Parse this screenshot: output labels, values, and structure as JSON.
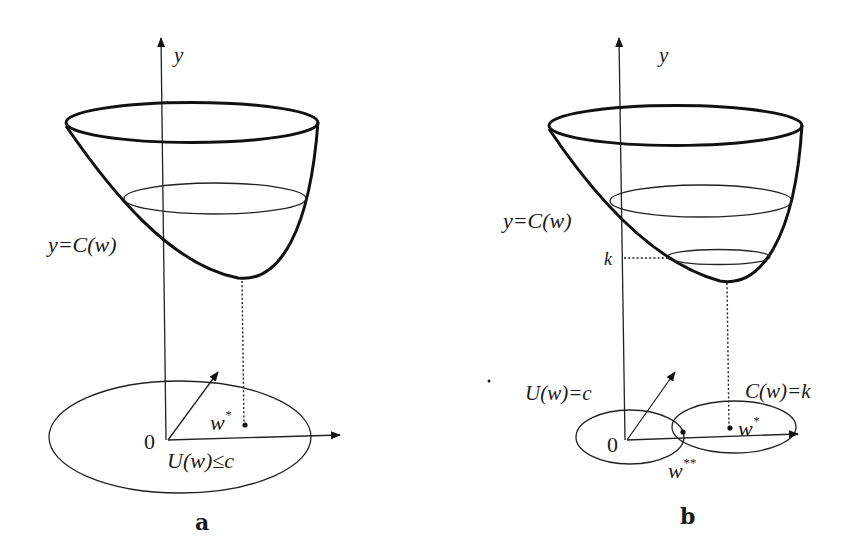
{
  "figure": {
    "background": "#ffffff",
    "ink_color": "#111111",
    "panels": [
      {
        "id": "a",
        "panel_label": "a",
        "axis_label_y": "y",
        "surface_label": "y=C(w)",
        "origin_label": "0",
        "point_label": "w",
        "point_superscript": "*",
        "region_label": "U(w)≤c",
        "elements": [
          "paraboloid bowl y=C(w)",
          "vertical y-axis",
          "3D ground axes",
          "ellipse region U(w)≤c",
          "dotted projection from bowl minimum to w*"
        ]
      },
      {
        "id": "b",
        "panel_label": "b",
        "axis_label_y": "y",
        "surface_label": "y=C(w)",
        "level_label": "k",
        "origin_label": "0",
        "constraint_label": "U(w)=c",
        "level_set_label": "C(w)=k",
        "point_label": "w",
        "point_superscript": "*",
        "tangent_point_label": "w",
        "tangent_point_superscript": "**",
        "elements": [
          "paraboloid bowl y=C(w)",
          "level ring at height k",
          "vertical y-axis",
          "3D ground axes",
          "ellipse U(w)=c",
          "ellipse C(w)=k tangent at w**",
          "dotted projection to w*"
        ]
      }
    ]
  }
}
